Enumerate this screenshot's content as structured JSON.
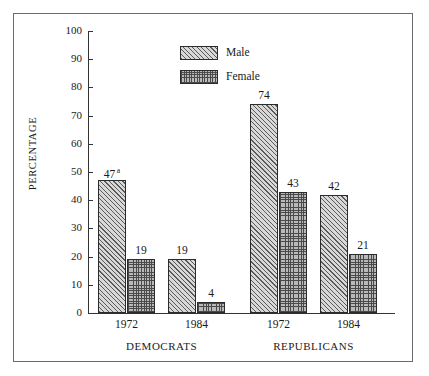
{
  "chart_data": {
    "type": "bar",
    "title": "",
    "subtitle": "",
    "xlabel": "",
    "ylabel": "PERCENTAGE",
    "ylim": [
      0,
      100
    ],
    "ytick_labels": [
      "100",
      "90",
      "80",
      "70",
      "60",
      "50",
      "40",
      "30",
      "20",
      "10",
      "0"
    ],
    "ytick_values": [
      100,
      90,
      80,
      70,
      60,
      50,
      40,
      30,
      20,
      10,
      0
    ],
    "grid": false,
    "legend_position": "top-center",
    "categories": [
      "1972",
      "1984",
      "1972",
      "1984"
    ],
    "group_labels": [
      "DEMOCRATS",
      "REPUBLICANS"
    ],
    "series": [
      {
        "name": "Male",
        "values": [
          47,
          19,
          74,
          42
        ]
      },
      {
        "name": "Female",
        "values": [
          19,
          4,
          43,
          21
        ]
      }
    ],
    "bar_labels": [
      {
        "text": "47",
        "superscript": "a"
      },
      {
        "text": "19",
        "superscript": ""
      },
      {
        "text": "19",
        "superscript": ""
      },
      {
        "text": "4",
        "superscript": ""
      },
      {
        "text": "74",
        "superscript": ""
      },
      {
        "text": "43",
        "superscript": ""
      },
      {
        "text": "42",
        "superscript": ""
      },
      {
        "text": "21",
        "superscript": ""
      }
    ],
    "annotations": [
      "a"
    ],
    "colors": {
      "male_fill": "#d8d8d8",
      "male_hatch": "#5a5a5a",
      "female_fill": "#b9b9b9",
      "female_hatch": "#4a4a4a",
      "axis": "#333333",
      "frame": "#6b6b6b",
      "text": "#1a1a1a"
    }
  },
  "axis": {
    "y_title": "PERCENTAGE",
    "ticks": [
      {
        "label": "100",
        "value": 100
      },
      {
        "label": "90",
        "value": 90
      },
      {
        "label": "80",
        "value": 80
      },
      {
        "label": "70",
        "value": 70
      },
      {
        "label": "60",
        "value": 60
      },
      {
        "label": "50",
        "value": 50
      },
      {
        "label": "40",
        "value": 40
      },
      {
        "label": "30",
        "value": 30
      },
      {
        "label": "20",
        "value": 20
      },
      {
        "label": "10",
        "value": 10
      },
      {
        "label": "0",
        "value": 0
      }
    ]
  },
  "legend": {
    "items": [
      {
        "label": "Male",
        "pattern": "diagonal-hatch"
      },
      {
        "label": "Female",
        "pattern": "crosshatch-dots"
      }
    ]
  },
  "xaxis": {
    "tick_labels": [
      "1972",
      "1984",
      "1972",
      "1984"
    ],
    "groups": [
      "DEMOCRATS",
      "REPUBLICANS"
    ]
  },
  "bars": [
    {
      "value": 47,
      "label": "47",
      "superscript": "a",
      "series": "Male",
      "group": "DEMOCRATS",
      "year": "1972"
    },
    {
      "value": 19,
      "label": "19",
      "superscript": "",
      "series": "Female",
      "group": "DEMOCRATS",
      "year": "1972"
    },
    {
      "value": 19,
      "label": "19",
      "superscript": "",
      "series": "Male",
      "group": "DEMOCRATS",
      "year": "1984"
    },
    {
      "value": 4,
      "label": "4",
      "superscript": "",
      "series": "Female",
      "group": "DEMOCRATS",
      "year": "1984"
    },
    {
      "value": 74,
      "label": "74",
      "superscript": "",
      "series": "Male",
      "group": "REPUBLICANS",
      "year": "1972"
    },
    {
      "value": 43,
      "label": "43",
      "superscript": "",
      "series": "Female",
      "group": "REPUBLICANS",
      "year": "1972"
    },
    {
      "value": 42,
      "label": "42",
      "superscript": "",
      "series": "Male",
      "group": "REPUBLICANS",
      "year": "1984"
    },
    {
      "value": 21,
      "label": "21",
      "superscript": "",
      "series": "Female",
      "group": "REPUBLICANS",
      "year": "1984"
    }
  ]
}
